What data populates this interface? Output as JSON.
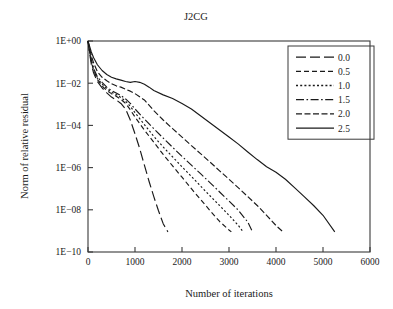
{
  "chart_data": {
    "type": "line",
    "title": "J2CG",
    "xlabel": "Number of iterations",
    "ylabel": "Norm of relative residual",
    "xlim": [
      0,
      6000
    ],
    "ylim_log": [
      -10,
      0
    ],
    "yscale": "log",
    "grid": false,
    "legend_position": "upper right",
    "legend_title": "",
    "xticks": [
      0,
      1000,
      2000,
      3000,
      4000,
      5000,
      6000
    ],
    "xticklabels": [
      "0",
      "1000",
      "2000",
      "3000",
      "4000",
      "5000",
      "6000"
    ],
    "yticks": [
      1,
      0.01,
      0.0001,
      1e-06,
      1e-08,
      1e-10
    ],
    "yticklabels": [
      "1E+00",
      "1E−02",
      "1E−04",
      "1E−06",
      "1E−08",
      "1E−10"
    ],
    "series": [
      {
        "name": "0.0",
        "dash": "10,4",
        "x": [
          0,
          30,
          70,
          120,
          200,
          300,
          400,
          500,
          600,
          700,
          800,
          900,
          1000,
          1100,
          1200,
          1300,
          1400,
          1500,
          1600,
          1700
        ],
        "y": [
          1.0,
          0.3,
          0.08,
          0.03,
          0.012,
          0.006,
          0.0035,
          0.0022,
          0.0016,
          0.0011,
          0.0006,
          0.00018,
          4e-05,
          8e-06,
          1.3e-06,
          2.2e-07,
          4.2e-08,
          9e-09,
          2.2e-09,
          9e-10
        ]
      },
      {
        "name": "0.5",
        "dash": "5,3",
        "x": [
          0,
          30,
          70,
          120,
          200,
          300,
          400,
          500,
          600,
          700,
          800,
          900,
          1000,
          1200,
          1400,
          1600,
          1800,
          2000,
          2200,
          2400,
          2600,
          2800,
          3000,
          3050
        ],
        "y": [
          1.0,
          0.35,
          0.1,
          0.04,
          0.015,
          0.0075,
          0.0045,
          0.0032,
          0.0024,
          0.0017,
          0.0011,
          0.00055,
          0.00025,
          6e-05,
          1.6e-05,
          4.2e-06,
          1.2e-06,
          3.5e-07,
          1e-07,
          3e-08,
          9e-09,
          2.8e-09,
          1.1e-09,
          9e-10
        ]
      },
      {
        "name": "1.0",
        "dash": "2,2.2",
        "x": [
          0,
          30,
          70,
          120,
          200,
          300,
          400,
          500,
          600,
          700,
          800,
          900,
          1000,
          1200,
          1400,
          1600,
          1800,
          2000,
          2200,
          2400,
          2600,
          2800,
          3000,
          3200,
          3300
        ],
        "y": [
          1.0,
          0.38,
          0.11,
          0.045,
          0.017,
          0.009,
          0.0055,
          0.0038,
          0.0029,
          0.0021,
          0.0014,
          0.0008,
          0.0004,
          0.00011,
          3e-05,
          9.5e-06,
          3.2e-06,
          1.1e-06,
          3.8e-07,
          1.3e-07,
          4.5e-08,
          1.6e-08,
          5.5e-09,
          1.8e-09,
          9e-10
        ]
      },
      {
        "name": "1.5",
        "dash": "8,2.5,1.6,2.5",
        "x": [
          0,
          30,
          70,
          120,
          200,
          300,
          400,
          500,
          600,
          700,
          800,
          900,
          1000,
          1200,
          1400,
          1600,
          1800,
          2000,
          2200,
          2400,
          2600,
          2800,
          3000,
          3200,
          3400,
          3500
        ],
        "y": [
          1.0,
          0.4,
          0.13,
          0.05,
          0.02,
          0.011,
          0.0065,
          0.0045,
          0.0034,
          0.0026,
          0.0018,
          0.0011,
          0.0006,
          0.0002,
          7e-05,
          2.5e-05,
          9.2e-06,
          3.4e-06,
          1.3e-06,
          5e-07,
          1.9e-07,
          7e-08,
          2.6e-08,
          9.5e-09,
          2.6e-09,
          9e-10
        ]
      },
      {
        "name": "2.0",
        "dash": "6,2.5",
        "x": [
          0,
          30,
          70,
          120,
          200,
          300,
          400,
          500,
          600,
          700,
          800,
          900,
          1000,
          1200,
          1400,
          1600,
          1800,
          2000,
          2200,
          2400,
          2600,
          2800,
          3000,
          3200,
          3400,
          3600,
          3800,
          4000,
          4150
        ],
        "y": [
          1.0,
          0.5,
          0.2,
          0.09,
          0.035,
          0.019,
          0.013,
          0.0095,
          0.0075,
          0.0065,
          0.0052,
          0.0042,
          0.0032,
          0.0016,
          0.0005,
          0.00018,
          7e-05,
          2.8e-05,
          1.1e-05,
          4.5e-06,
          1.8e-06,
          7e-07,
          2.8e-07,
          1.1e-07,
          4.2e-08,
          1.6e-08,
          5.5e-09,
          1.8e-09,
          9e-10
        ]
      },
      {
        "name": "2.5",
        "dash": "none",
        "x": [
          0,
          30,
          70,
          120,
          200,
          300,
          400,
          500,
          600,
          700,
          800,
          900,
          1000,
          1100,
          1200,
          1300,
          1400,
          1600,
          1800,
          2000,
          2200,
          2400,
          2600,
          2800,
          3000,
          3200,
          3400,
          3600,
          3800,
          4000,
          4200,
          4400,
          4600,
          4800,
          5000,
          5250
        ],
        "y": [
          1.0,
          0.6,
          0.3,
          0.16,
          0.075,
          0.04,
          0.026,
          0.019,
          0.016,
          0.014,
          0.012,
          0.011,
          0.012,
          0.011,
          0.009,
          0.0065,
          0.0045,
          0.0028,
          0.0019,
          0.0011,
          0.0006,
          0.00028,
          0.00013,
          6e-05,
          2.8e-05,
          1.3e-05,
          5.5e-06,
          2.4e-06,
          1.1e-06,
          6e-07,
          2.8e-07,
          1.1e-07,
          4.2e-08,
          1.6e-08,
          5.5e-09,
          9e-10
        ]
      }
    ]
  },
  "colors": {
    "ink": "#1a1a1a",
    "axis": "#3a3a3a",
    "background": "#ffffff"
  }
}
